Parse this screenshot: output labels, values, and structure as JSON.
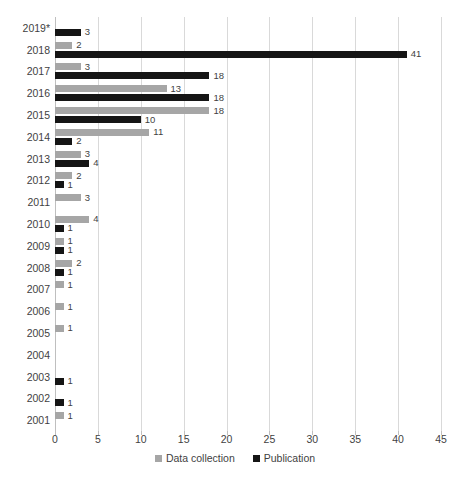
{
  "chart_data": {
    "type": "bar",
    "orientation": "horizontal",
    "title": "",
    "xlabel": "",
    "ylabel": "",
    "xlim": [
      0,
      45
    ],
    "xticks": [
      "0",
      "5",
      "10",
      "15",
      "20",
      "25",
      "30",
      "35",
      "40",
      "45"
    ],
    "grid": "vertical",
    "legend_position": "bottom-center",
    "categories": [
      "2019*",
      "2018",
      "2017",
      "2016",
      "2015",
      "2014",
      "2013",
      "2012",
      "2011",
      "2010",
      "2009",
      "2008",
      "2007",
      "2006",
      "2005",
      "2004",
      "2003",
      "2002",
      "2001"
    ],
    "series": [
      {
        "name": "Data collection",
        "color": "#a6a6a6",
        "values": [
          null,
          2,
          3,
          13,
          18,
          11,
          3,
          2,
          3,
          4,
          1,
          2,
          1,
          1,
          1,
          null,
          null,
          null,
          1
        ],
        "labels": [
          "",
          "2",
          "3",
          "13",
          "18",
          "11",
          "3",
          "2",
          "3",
          "4",
          "1",
          "2",
          "1",
          "1",
          "1",
          "",
          "",
          "",
          "1"
        ]
      },
      {
        "name": "Publication",
        "color": "#151515",
        "values": [
          3,
          41,
          18,
          18,
          10,
          2,
          4,
          1,
          null,
          1,
          1,
          1,
          null,
          null,
          null,
          null,
          1,
          1,
          null
        ],
        "labels": [
          "3",
          "41",
          "18",
          "18",
          "10",
          "2",
          "4",
          "1",
          "",
          "1",
          "1",
          "1",
          "",
          "",
          "",
          "",
          "1",
          "1",
          ""
        ]
      }
    ]
  },
  "legend": {
    "items": [
      {
        "label": "Data collection",
        "swatch": "dc"
      },
      {
        "label": "Publication",
        "swatch": "pub"
      }
    ]
  }
}
